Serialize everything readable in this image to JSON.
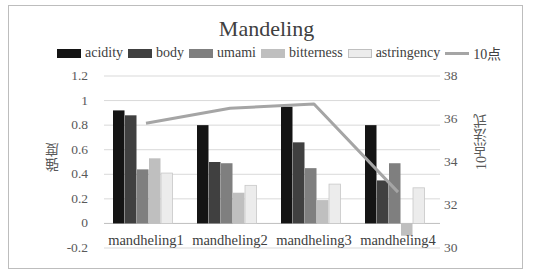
{
  "chart_data": {
    "type": "bar",
    "title": "Mandeling",
    "categories": [
      "mandheling1",
      "mandheling2",
      "mandheling3",
      "mandheling4"
    ],
    "series": [
      {
        "name": "acidity",
        "axis": "left",
        "type": "bar",
        "color": "#141414",
        "values": [
          0.92,
          0.8,
          0.95,
          0.8
        ]
      },
      {
        "name": "body",
        "axis": "left",
        "type": "bar",
        "color": "#404040",
        "values": [
          0.88,
          0.5,
          0.66,
          0.35
        ]
      },
      {
        "name": "umami",
        "axis": "left",
        "type": "bar",
        "color": "#7f7f7f",
        "values": [
          0.44,
          0.49,
          0.45,
          0.49
        ]
      },
      {
        "name": "bitterness",
        "axis": "left",
        "type": "bar",
        "color": "#bfbfbf",
        "values": [
          0.53,
          0.25,
          0.19,
          -0.1
        ]
      },
      {
        "name": "astringency",
        "axis": "left",
        "type": "bar",
        "color": "#ececec",
        "values": [
          0.41,
          0.31,
          0.32,
          0.29
        ]
      },
      {
        "name": "10点",
        "axis": "right",
        "type": "line",
        "color": "#a5a5a5",
        "values": [
          35.8,
          36.5,
          36.7,
          32.6
        ]
      }
    ],
    "ylabel": "強度",
    "y2label": "10点法式",
    "xlabel": "",
    "ylim": [
      -0.2,
      1.2
    ],
    "y2lim": [
      30,
      38
    ],
    "yticks": [
      "1.2",
      "1",
      "0.8",
      "0.6",
      "0.4",
      "0.2",
      "0",
      "-0.2"
    ],
    "y2ticks": [
      "38",
      "36",
      "34",
      "32",
      "30"
    ],
    "grid": true,
    "legend_position": "top"
  }
}
